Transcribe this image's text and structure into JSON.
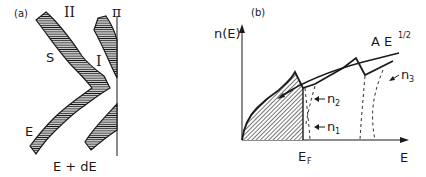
{
  "panel_a": {
    "tag": "(a)",
    "labels": {
      "region_II": "II",
      "region_I": "I",
      "surface_S": "S",
      "plane_pi": "π",
      "energy_E": "E",
      "energy_E_dE": "E + dE"
    }
  },
  "panel_b": {
    "tag": "(b)",
    "y_axis_label": "n(E)",
    "x_axis_label": "E",
    "fermi_label_main": "E",
    "fermi_label_sub": "F",
    "curve_label_main": "A E",
    "curve_label_sup": "1/2",
    "band_labels": {
      "n1_main": "n",
      "n1_sub": "1",
      "n2_main": "n",
      "n2_sub": "2",
      "n3_main": "n",
      "n3_sub": "3"
    }
  },
  "colors": {
    "ink": "#1a1a1a",
    "background": "#ffffff"
  }
}
